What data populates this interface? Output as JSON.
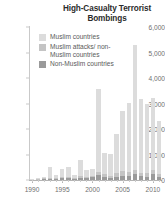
{
  "chart": {
    "title": "High-Casualty Terrorist Bombings"
  },
  "legend": {
    "position": "inside-top-left",
    "items": [
      {
        "label": "Muslim countries",
        "color": "#dcdcdc"
      },
      {
        "label": "Muslim attacks/ non-Muslim countries",
        "color": "#c4c4c4"
      },
      {
        "label": "Non-Muslim countries",
        "color": "#9a9a9a"
      }
    ]
  },
  "axes": {
    "y_ticks": [
      "0",
      "1,000",
      "2,000",
      "3,000",
      "4,000",
      "5,000",
      "6,000"
    ],
    "x_ticks": [
      "1990",
      "1995",
      "2000",
      "2005",
      "2010"
    ]
  },
  "chart_data": {
    "type": "bar",
    "stacked": true,
    "title": "High-Casualty Terrorist Bombings",
    "xlabel": "",
    "ylabel": "",
    "ylim": [
      0,
      6000
    ],
    "ytick_values": [
      0,
      1000,
      2000,
      3000,
      4000,
      5000,
      6000
    ],
    "grid": false,
    "legend_position": "inside-top-left",
    "categories": [
      "1990",
      "1991",
      "1992",
      "1993",
      "1994",
      "1995",
      "1996",
      "1997",
      "1998",
      "1999",
      "2000",
      "2001",
      "2002",
      "2003",
      "2004",
      "2005",
      "2006",
      "2007",
      "2008",
      "2009",
      "2010",
      "2011"
    ],
    "series": [
      {
        "name": "Muslim countries",
        "color": "#dcdcdc",
        "values": [
          20,
          30,
          60,
          420,
          120,
          330,
          380,
          120,
          640,
          300,
          280,
          3250,
          820,
          860,
          1560,
          2360,
          2700,
          4900,
          2900,
          2700,
          2800,
          2100
        ]
      },
      {
        "name": "Muslim attacks/ non-Muslim countries",
        "color": "#c4c4c4",
        "values": [
          5,
          10,
          20,
          30,
          30,
          40,
          40,
          30,
          60,
          40,
          40,
          120,
          120,
          90,
          140,
          180,
          160,
          180,
          140,
          150,
          160,
          120
        ]
      },
      {
        "name": "Non-Muslim countries",
        "color": "#9a9a9a",
        "values": [
          20,
          30,
          40,
          60,
          60,
          80,
          80,
          60,
          90,
          70,
          130,
          180,
          130,
          80,
          120,
          170,
          150,
          220,
          150,
          130,
          240,
          110
        ]
      }
    ]
  },
  "style": {
    "background": "#ffffff",
    "axis_color": "#c9c9c9",
    "tick_text_color": "#6f6f6f",
    "title_color": "#2b2b2b"
  }
}
